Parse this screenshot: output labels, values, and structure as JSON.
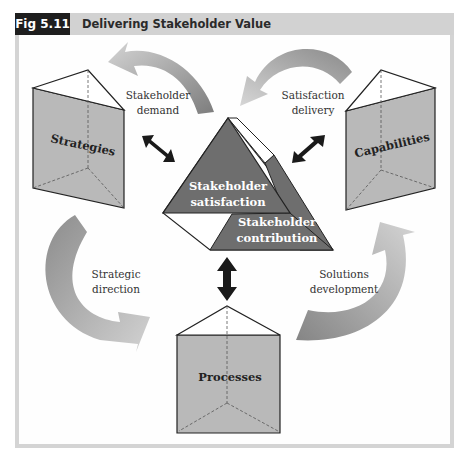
{
  "figure": {
    "number": "Fig 5.11",
    "title": "Delivering Stakeholder Value"
  },
  "colors": {
    "header_bg": "#d2d2d2",
    "label_bg": "#1e1e1e",
    "prism_face": "#b9b9b9",
    "pyramid_dark": "#6e6e6e",
    "arrow_dark": "#8a8a8a",
    "arrow_light": "#cdcdcd",
    "double_arrow": "#1a1a1a"
  },
  "nodes": {
    "strategies": "Strategies",
    "capabilities": "Capabilities",
    "processes": "Processes",
    "satisfaction_line1": "Stakeholder",
    "satisfaction_line2": "satisfaction",
    "contribution_line1": "Stakeholder",
    "contribution_line2": "contribution"
  },
  "flows": {
    "stakeholder_demand_line1": "Stakeholder",
    "stakeholder_demand_line2": "demand",
    "satisfaction_delivery_line1": "Satisfaction",
    "satisfaction_delivery_line2": "delivery",
    "strategic_direction_line1": "Strategic",
    "strategic_direction_line2": "direction",
    "solutions_development_line1": "Solutions",
    "solutions_development_line2": "development"
  }
}
